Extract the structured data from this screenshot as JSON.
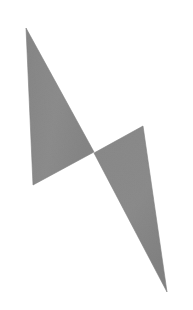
{
  "image": {
    "title": "Abstract two-triangle figure",
    "width": 193,
    "height": 310,
    "background_color": "#ffffff",
    "caption": ""
  },
  "palette": {
    "background": "#ffffff",
    "shape_fill": "#8a8a8a",
    "shape_fill_dark": "#7e7e7e",
    "shape_edge": "#6f6f6f",
    "grain_color": "#9a9a9a"
  },
  "shapes": [
    {
      "id": "upper-triangle",
      "name": "upper-left-triangle",
      "type": "triangle",
      "fill": "#8a8a8a",
      "points": "26,28 33,185 94,152",
      "vertices": [
        {
          "label": "apex-top",
          "x": 26,
          "y": 28
        },
        {
          "label": "bottom-left",
          "x": 33,
          "y": 185
        },
        {
          "label": "right",
          "x": 94,
          "y": 152
        }
      ]
    },
    {
      "id": "lower-triangle",
      "name": "lower-right-triangle",
      "type": "triangle",
      "fill": "#8a8a8a",
      "points": "94,153 143,126 167,292",
      "vertices": [
        {
          "label": "left",
          "x": 94,
          "y": 153
        },
        {
          "label": "top-right",
          "x": 143,
          "y": 126
        },
        {
          "label": "bottom-tip",
          "x": 167,
          "y": 292
        }
      ]
    }
  ],
  "composition": {
    "description": "Two solid gray triangles meeting point-to-point near the center, forming a lightning-bolt / Z silhouette on a plain white field.",
    "contact_point": {
      "x": 94,
      "y": 152
    },
    "shape_count": 2
  }
}
